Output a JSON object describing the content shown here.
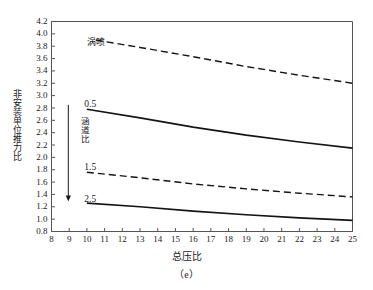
{
  "figure": {
    "caption": "（e）",
    "background": "#ffffff",
    "line_color": "#141414",
    "axis_color": "#555555"
  },
  "chart_data": {
    "type": "line",
    "title": "",
    "subtitle": "",
    "xlabel": "总压比",
    "ylabel": "非安装单位推力比",
    "xlim": [
      8,
      25
    ],
    "ylim": [
      0.8,
      4.2
    ],
    "grid": false,
    "legend_position": "inline-annotations",
    "x_ticks": [
      8,
      9,
      10,
      11,
      12,
      13,
      14,
      15,
      16,
      17,
      18,
      19,
      20,
      21,
      22,
      23,
      24,
      25
    ],
    "x_tick_labels": [
      "8",
      "9",
      "10",
      "11",
      "12",
      "13",
      "14",
      "15",
      "16",
      "17",
      "18",
      "19",
      "20",
      "21",
      "22",
      "23",
      "24",
      "25"
    ],
    "y_ticks": [
      0.8,
      1.0,
      1.2,
      1.4,
      1.6,
      1.8,
      2.0,
      2.2,
      2.4,
      2.6,
      2.8,
      3.0,
      3.2,
      3.4,
      3.6,
      3.8,
      4.0,
      4.2
    ],
    "y_tick_labels": [
      "0.8",
      "1.0",
      "1.2",
      "1.4",
      "1.6",
      "1.8",
      "2.0",
      "2.2",
      "2.4",
      "2.6",
      "2.8",
      "3.0",
      "3.2",
      "3.4",
      "3.6",
      "3.8",
      "4.0",
      "4.2"
    ],
    "series": [
      {
        "name": "涡喷",
        "style": "dashed",
        "label": "涡喷",
        "x": [
          10.5,
          13,
          16,
          19,
          22,
          25
        ],
        "values": [
          3.9,
          3.78,
          3.63,
          3.47,
          3.33,
          3.2
        ]
      },
      {
        "name": "涵道比 0.5",
        "style": "solid",
        "label": "0.5",
        "x": [
          10,
          13,
          16,
          19,
          22,
          25
        ],
        "values": [
          2.78,
          2.64,
          2.49,
          2.36,
          2.25,
          2.15
        ]
      },
      {
        "name": "涵道比 1.5",
        "style": "dashed",
        "label": "1.5",
        "x": [
          10,
          13,
          16,
          19,
          22,
          25
        ],
        "values": [
          1.76,
          1.67,
          1.57,
          1.49,
          1.42,
          1.36
        ]
      },
      {
        "name": "涵道比 2.5",
        "style": "solid",
        "label": "2.5",
        "x": [
          10,
          13,
          16,
          19,
          22,
          25
        ],
        "values": [
          1.26,
          1.2,
          1.13,
          1.07,
          1.02,
          0.98
        ]
      }
    ],
    "annotations": [
      {
        "id": "turbojet",
        "text": "涡喷",
        "x": 10.0,
        "y": 3.82
      },
      {
        "id": "bypass-group",
        "text": "涵道比",
        "x": 9.0,
        "y": 2.3,
        "orientation": "vertical"
      },
      {
        "id": "bypass-05",
        "text": "0.5",
        "x": 9.85,
        "y": 2.82
      },
      {
        "id": "bypass-15",
        "text": "1.5",
        "x": 9.85,
        "y": 1.8
      },
      {
        "id": "bypass-25",
        "text": "2.5",
        "x": 9.85,
        "y": 1.28
      },
      {
        "id": "bypass-arrow",
        "text": "",
        "from_y": 2.85,
        "to_y": 1.3,
        "x": 8.95
      }
    ]
  }
}
